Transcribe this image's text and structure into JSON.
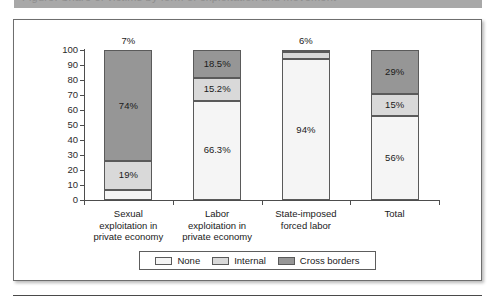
{
  "header": {
    "strip_text": "Figure: Share of victims by form of exploitation and movement"
  },
  "chart_data": {
    "type": "bar",
    "stacked": true,
    "title": "",
    "subtitle": "",
    "xlabel": "",
    "ylabel": "",
    "ylim": [
      0,
      100
    ],
    "yticks": [
      "100",
      "90",
      "80",
      "70",
      "60",
      "50",
      "40",
      "30",
      "20",
      "10",
      "0"
    ],
    "grid": false,
    "legend_position": "bottom",
    "categories": [
      "Sexual exploitation in private economy",
      "Labor exploitation in private economy",
      "State-imposed forced labor",
      "Total"
    ],
    "category_lines": [
      [
        "Sexual",
        "exploitation in",
        "private economy"
      ],
      [
        "Labor",
        "exploitation in",
        "private economy"
      ],
      [
        "State-imposed",
        "forced labor"
      ],
      [
        "Total"
      ]
    ],
    "series": [
      {
        "name": "None",
        "color": "#f5f5f5",
        "values": [
          7,
          66.3,
          94,
          56
        ],
        "labels": [
          "7%",
          "66.3%",
          "94%",
          "56%"
        ]
      },
      {
        "name": "Internal",
        "color": "#d9d9d9",
        "values": [
          19,
          15.2,
          5,
          15
        ],
        "labels": [
          "19%",
          "15.2%",
          "6%",
          "15%"
        ]
      },
      {
        "name": "Cross borders",
        "color": "#969696",
        "values": [
          74,
          18.5,
          1,
          29
        ],
        "labels": [
          "74%",
          "18.5%",
          "",
          "29%"
        ]
      }
    ]
  },
  "legend": {
    "items": [
      {
        "label": "None",
        "color": "#f5f5f5"
      },
      {
        "label": "Internal",
        "color": "#d9d9d9"
      },
      {
        "label": "Cross borders",
        "color": "#969696"
      }
    ]
  },
  "colors": {
    "none": "#f5f5f5",
    "internal": "#d9d9d9",
    "cross_borders": "#969696",
    "axis": "#4d4d4d",
    "frame": "#6e6e6e"
  }
}
